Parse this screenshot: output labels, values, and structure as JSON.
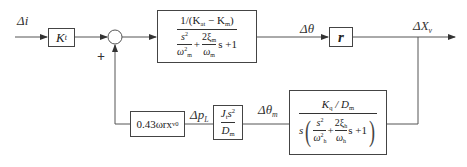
{
  "diagram": {
    "type": "control-system-block-diagram",
    "signals": {
      "input": "Δi",
      "theta": "Δθ",
      "output": "ΔX",
      "output_sub": "v",
      "theta_m": "Δθ",
      "theta_m_sub": "m",
      "p_l": "Δp",
      "p_l_sub": "L"
    },
    "summing_junction": {
      "sign_feedback": "+"
    },
    "blocks": {
      "kt": {
        "symbol": "K",
        "sub": "t"
      },
      "tf_main": {
        "num_text": "1/(K",
        "num_sub1": "at",
        "num_mid": " − K",
        "num_sub2": "m",
        "num_close": ")",
        "den_term1_num": "s",
        "den_term1_num_sup": "2",
        "den_term1_den": "ω",
        "den_term1_den_sup": "2",
        "den_term1_den_sub": "m",
        "plus1": "+",
        "den_term2_num": "2ξ",
        "den_term2_num_sub": "m",
        "den_term2_den": "ω",
        "den_term2_den_sub": "m",
        "tail": "s +1"
      },
      "r": {
        "symbol": "r"
      },
      "tf_motor": {
        "num_k": "K",
        "num_k_sub": "q",
        "num_slash": " / D",
        "num_d_sub": "m",
        "lead_s": "s",
        "term1_num": "s",
        "term1_num_sup": "2",
        "term1_den": "ω",
        "term1_den_sup": "2",
        "term1_den_sub": "h",
        "plus": "+",
        "term2_num": "2ξ",
        "term2_num_sub": "h",
        "term2_den": "ω",
        "term2_den_sub": "h",
        "tail": "s +1"
      },
      "jt": {
        "num": "J",
        "num_sub": "t",
        "num_s": "s",
        "num_sup": "2",
        "den": "D",
        "den_sub": "m"
      },
      "gain": {
        "text": "0.43ωrx",
        "sub": "v0"
      }
    }
  }
}
